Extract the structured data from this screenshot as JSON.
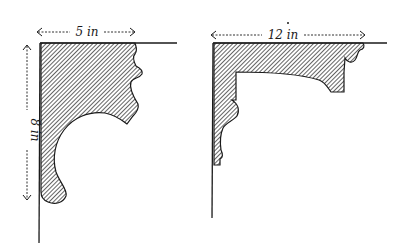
{
  "figures": [
    {
      "id": "left-profile",
      "dimensions": {
        "width_label": "5 in",
        "height_label": "8 in"
      }
    },
    {
      "id": "right-profile",
      "dimensions": {
        "width_label": "12 in"
      }
    }
  ],
  "colors": {
    "ink": "#1a1a1a",
    "paper": "#ffffff"
  }
}
